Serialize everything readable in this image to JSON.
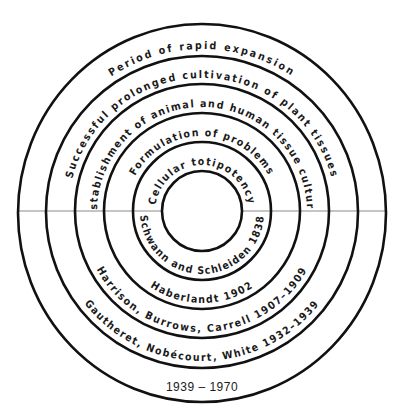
{
  "diagram": {
    "colors": {
      "stroke": "#111111",
      "text": "#1a1a1a",
      "axis": "#8a8a8a",
      "background": "#ffffff"
    },
    "center": [
      202,
      212
    ],
    "rings": [
      {
        "index": 0,
        "radius": 40
      },
      {
        "index": 1,
        "radius": 69
      },
      {
        "index": 2,
        "radius": 98
      },
      {
        "index": 3,
        "radius": 127
      },
      {
        "index": 4,
        "radius": 156
      },
      {
        "index": 5,
        "radius": 186
      }
    ],
    "upper_labels": [
      {
        "ring": 1,
        "text": "Cellular totipotency"
      },
      {
        "ring": 2,
        "text": "Formulation of problems"
      },
      {
        "ring": 3,
        "text": "Establishment of animal and human tissue culture"
      },
      {
        "ring": 4,
        "text": "Successful prolonged cultivation of plant tissues"
      },
      {
        "ring": 5,
        "text": "Period of rapid expansion"
      }
    ],
    "lower_labels": [
      {
        "ring": 1,
        "text": "Schwann and Schleiden 1838"
      },
      {
        "ring": 2,
        "text": "Haberlandt 1902"
      },
      {
        "ring": 3,
        "text": "Harrison, Burrows, Carrell 1907–1909"
      },
      {
        "ring": 4,
        "text": "Gautheret, Nobécourt, White 1932–1939"
      },
      {
        "ring": 5,
        "text": "1939 – 1970"
      }
    ]
  }
}
